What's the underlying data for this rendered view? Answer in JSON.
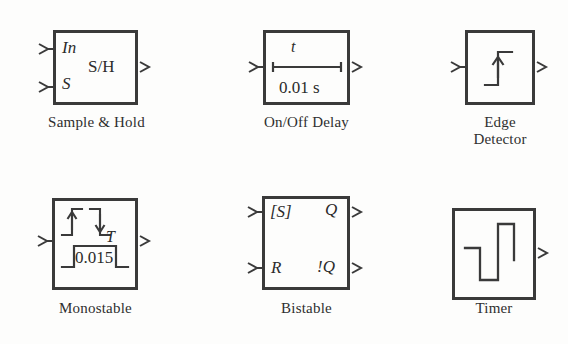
{
  "figure": {
    "background_color": "#fdfdfc",
    "line_color": "#3a3a3a",
    "text_color": "#2b2b2b"
  },
  "blocks": [
    {
      "id": "sample-hold",
      "caption": "Sample & Hold",
      "inputs": [
        {
          "label": "In"
        },
        {
          "label": "S"
        }
      ],
      "outputs": [
        {
          "label": "S/H"
        }
      ],
      "body_label": "S/H"
    },
    {
      "id": "on-off-delay",
      "caption": "On/Off Delay",
      "inputs": [
        {
          "label": ""
        }
      ],
      "outputs": [
        {
          "label": ""
        }
      ],
      "time_symbol": "t",
      "time_value": "0.01 s"
    },
    {
      "id": "edge-detector",
      "caption": "Edge\nDetector",
      "inputs": [
        {
          "label": ""
        }
      ],
      "outputs": [
        {
          "label": ""
        }
      ],
      "glyph": "rising-edge-step"
    },
    {
      "id": "monostable",
      "caption": "Monostable",
      "inputs": [
        {
          "label": ""
        }
      ],
      "outputs": [
        {
          "label": ""
        }
      ],
      "time_symbol": "T",
      "time_value": "0.015",
      "glyph": "pulse-waveform"
    },
    {
      "id": "bistable",
      "caption": "Bistable",
      "inputs": [
        {
          "label": "[S]"
        },
        {
          "label": "R"
        }
      ],
      "outputs": [
        {
          "label": "Q"
        },
        {
          "label": "!Q"
        }
      ]
    },
    {
      "id": "timer",
      "caption": "Timer",
      "inputs": [],
      "outputs": [
        {
          "label": ""
        }
      ],
      "glyph": "square-wave"
    }
  ]
}
